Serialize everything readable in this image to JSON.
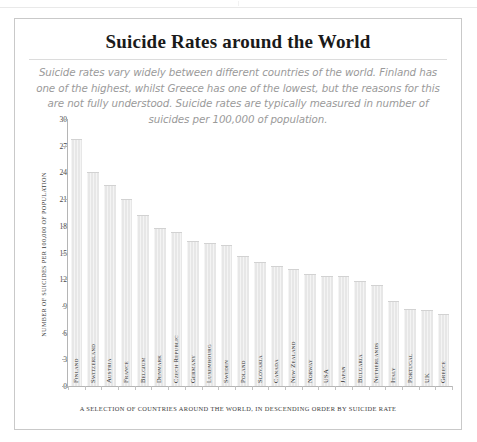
{
  "chart_data": {
    "type": "bar",
    "title": "Suicide Rates around the World",
    "subtitle": "Suicide rates vary widely between different countries of the world. Finland has one of the highest, whilst Greece has one of the lowest, but the reasons for this are not fully understood. Suicide rates are typically measured in number of suicides per 100,000 of population.",
    "xlabel": "A SELECTION OF COUNTRIES AROUND THE WORLD, IN DESCENDING ORDER BY SUICIDE RATE",
    "ylabel": "NUMBER OF SUICIDES PER 100,000 OF POPULATION",
    "ylim": [
      0,
      30
    ],
    "yticks": [
      0,
      3,
      6,
      9,
      12,
      15,
      18,
      21,
      24,
      27,
      30
    ],
    "grid": false,
    "legend": false,
    "bar_color": "#e7e7e7",
    "categories": [
      "Finland",
      "Switzerland",
      "Austria",
      "France",
      "Belgium",
      "Denmark",
      "Czech Republic",
      "Germany",
      "Luxembourg",
      "Sweden",
      "Poland",
      "Slovakia",
      "Canada",
      "New Zealand",
      "Norway",
      "USA",
      "Japan",
      "Bulgaria",
      "Netherlands",
      "Italy",
      "Portugal",
      "UK",
      "Greece"
    ],
    "values": [
      27.8,
      24.0,
      22.6,
      21.0,
      19.2,
      17.7,
      17.3,
      16.3,
      16.1,
      15.9,
      14.6,
      13.9,
      13.5,
      13.2,
      12.6,
      12.4,
      12.4,
      11.8,
      11.3,
      9.6,
      8.6,
      8.5,
      8.1
    ]
  },
  "footer": {
    "caption": "A SELECTION OF COUNTRIES AROUND THE WORLD, IN DESCENDING ORDER BY SUICIDE RATE"
  }
}
